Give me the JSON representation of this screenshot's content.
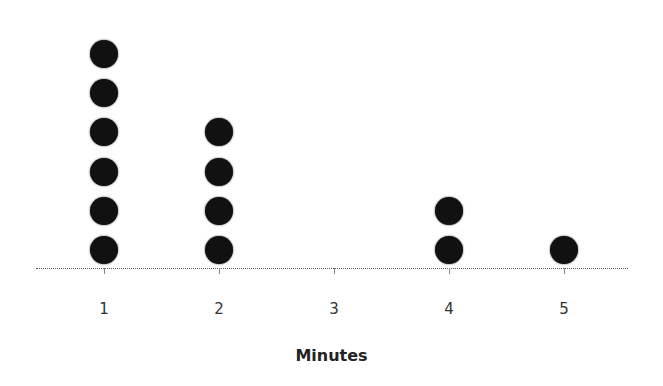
{
  "chart_data": {
    "type": "scatter",
    "subtype": "dot_plot",
    "title": "",
    "xlabel": "Minutes",
    "ylabel": "",
    "categories": [
      "1",
      "2",
      "3",
      "4",
      "5"
    ],
    "values": [
      6,
      4,
      0,
      2,
      1
    ],
    "x": [
      1,
      2,
      3,
      4,
      5
    ],
    "grid": false,
    "legend": null,
    "dot_color": "#111111"
  }
}
